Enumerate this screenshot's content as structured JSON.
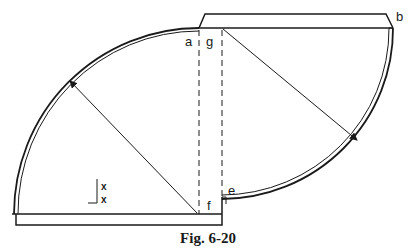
{
  "figure": {
    "caption": "Fig. 6-20",
    "labels": {
      "a": "a",
      "g": "g",
      "b": "b",
      "e": "e",
      "f": "f"
    },
    "marks": {
      "x1": "x",
      "x2": "x"
    }
  },
  "colors": {
    "stroke": "#1a1a1a",
    "background": "#ffffff"
  }
}
